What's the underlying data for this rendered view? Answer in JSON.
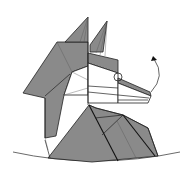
{
  "diagram": {
    "step_instruction": "Rotate snout up at the marked pivot point",
    "colors": {
      "paper_colored_side": "#8a8a8a",
      "paper_white_side": "#ffffff",
      "line": "#222222"
    },
    "symbols": [
      {
        "name": "pivot-circle",
        "meaning": "pivot point"
      },
      {
        "name": "curved-arrow",
        "meaning": "swing snout upward"
      }
    ]
  }
}
